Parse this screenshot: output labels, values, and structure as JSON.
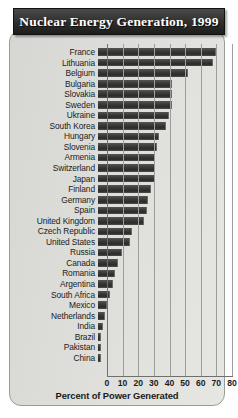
{
  "chart_data": {
    "type": "bar",
    "orientation": "horizontal",
    "title": "Nuclear Energy Generation, 1999",
    "xlabel": "Percent of Power Generated",
    "ylabel": "",
    "xlim": [
      0,
      80
    ],
    "xticks": [
      0,
      10,
      20,
      30,
      40,
      50,
      60,
      70,
      80
    ],
    "grid": true,
    "legend": "none",
    "categories": [
      "France",
      "Lithuania",
      "Belgium",
      "Bulgaria",
      "Slovakia",
      "Sweden",
      "Ukraine",
      "South Korea",
      "Hungary",
      "Slovenia",
      "Armenia",
      "Switzerland",
      "Japan",
      "Finland",
      "Germany",
      "Spain",
      "United Kingdom",
      "Czech Republic",
      "United States",
      "Russia",
      "Canada",
      "Romania",
      "Argentina",
      "South Africa",
      "Mexico",
      "Netherlands",
      "India",
      "Brazil",
      "Pakistan",
      "China"
    ],
    "values": [
      75,
      73,
      57,
      47,
      47,
      46.5,
      45,
      42.8,
      38.3,
      37.2,
      36,
      36,
      36,
      33,
      31.2,
      31,
      28.9,
      20.8,
      19.8,
      14.4,
      12.4,
      10.4,
      9,
      7.1,
      5.2,
      4,
      2.6,
      1.1,
      0.8,
      0.8
    ]
  },
  "figure": {
    "title": "Nuclear Energy Generation, 1999",
    "axis_title": "Percent of Power Generated"
  }
}
